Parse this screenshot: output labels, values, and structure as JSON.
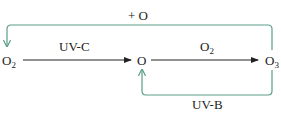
{
  "species": {
    "o2": {
      "base": "O",
      "sub": "2"
    },
    "o": {
      "base": "O"
    },
    "o3": {
      "base": "O",
      "sub": "3"
    }
  },
  "arrows": {
    "o2_to_o": {
      "label": "UV-C"
    },
    "o_to_o3": {
      "label_base": "O",
      "label_sub": "2"
    },
    "o3_to_o_loop": {
      "label": "UV-B"
    },
    "o3_to_o2_loop": {
      "label": "+ O"
    }
  },
  "colors": {
    "loop": "#5a9e8c",
    "arrow": "#222222"
  }
}
